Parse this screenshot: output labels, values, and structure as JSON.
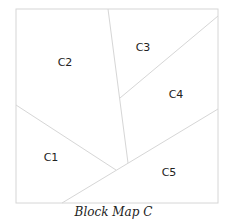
{
  "caption": "Block Map C",
  "colors": {
    "line": "#d6d6d6",
    "label": "#222222",
    "background": "#ffffff"
  },
  "frame": {
    "x1": 16,
    "y1": 9,
    "x2": 218,
    "y2": 203
  },
  "dividers": [
    {
      "id": "c1-c2",
      "x1": 16,
      "y1": 105,
      "x2": 116,
      "y2": 170
    },
    {
      "id": "c2-c3-c4",
      "x1": 108,
      "y1": 9,
      "x2": 128,
      "y2": 163
    },
    {
      "id": "c3-c4",
      "x1": 120,
      "y1": 98,
      "x2": 218,
      "y2": 16
    },
    {
      "id": "c4-c5-c1",
      "x1": 62,
      "y1": 203,
      "x2": 218,
      "y2": 109
    }
  ],
  "regions": [
    {
      "id": "C1",
      "label": "C1",
      "x": 51,
      "y": 157
    },
    {
      "id": "C2",
      "label": "C2",
      "x": 65,
      "y": 62
    },
    {
      "id": "C3",
      "label": "C3",
      "x": 143,
      "y": 47
    },
    {
      "id": "C4",
      "label": "C4",
      "x": 176,
      "y": 94
    },
    {
      "id": "C5",
      "label": "C5",
      "x": 169,
      "y": 172
    }
  ]
}
